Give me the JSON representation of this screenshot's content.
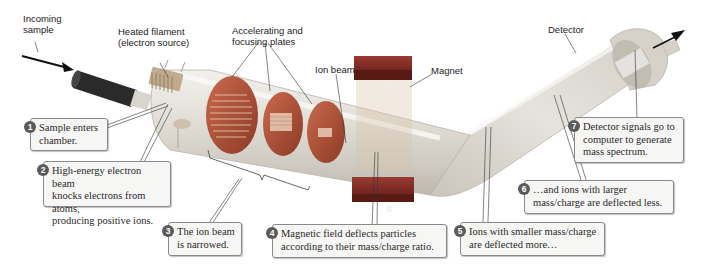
{
  "diagram": {
    "labels": {
      "incoming_sample": "Incoming\nsample",
      "heated_filament": "Heated filament\n(electron source)",
      "accelerating_plates": "Accelerating and\nfocusing plates",
      "ion_beam": "Ion beam",
      "magnet": "Magnet",
      "detector": "Detector",
      "magnet_north": "N",
      "magnet_south": "S"
    },
    "callouts": [
      {
        "number": "1",
        "text": "Sample enters\nchamber."
      },
      {
        "number": "2",
        "text": "High-energy electron beam\nknocks electrons from atoms,\nproducing positive ions."
      },
      {
        "number": "3",
        "text": "The ion beam\nis narrowed."
      },
      {
        "number": "4",
        "text": "Magnetic field deflects particles\naccording to their mass/charge ratio."
      },
      {
        "number": "5",
        "text": "Ions with smaller mass/charge\nare deflected more…"
      },
      {
        "number": "6",
        "text": "…and ions with larger\nmass/charge are deflected less."
      },
      {
        "number": "7",
        "text": "Detector signals go to\ncomputer to generate\nmass spectrum."
      }
    ],
    "colors": {
      "tube": "#d9d6cf",
      "plates": "#b5573e",
      "magnet": "#7a2a22",
      "badge": "#5a5a5a",
      "callout_bg": "#f6f6f4",
      "callout_border": "#8a8a8a"
    }
  }
}
